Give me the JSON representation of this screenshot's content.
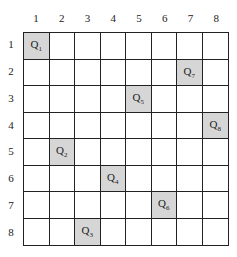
{
  "board": {
    "size": 8,
    "column_labels": [
      "1",
      "2",
      "3",
      "4",
      "5",
      "6",
      "7",
      "8"
    ],
    "row_labels": [
      "1",
      "2",
      "3",
      "4",
      "5",
      "6",
      "7",
      "8"
    ],
    "queens": [
      {
        "label": "Q",
        "index": "1",
        "row": 1,
        "col": 1
      },
      {
        "label": "Q",
        "index": "2",
        "row": 5,
        "col": 2
      },
      {
        "label": "Q",
        "index": "3",
        "row": 8,
        "col": 3
      },
      {
        "label": "Q",
        "index": "4",
        "row": 6,
        "col": 4
      },
      {
        "label": "Q",
        "index": "5",
        "row": 3,
        "col": 5
      },
      {
        "label": "Q",
        "index": "6",
        "row": 7,
        "col": 6
      },
      {
        "label": "Q",
        "index": "7",
        "row": 2,
        "col": 7
      },
      {
        "label": "Q",
        "index": "8",
        "row": 4,
        "col": 8
      }
    ],
    "highlight_color": "#d6d6d6"
  }
}
